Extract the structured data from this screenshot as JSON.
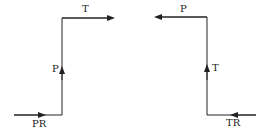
{
  "diagrams": [
    {
      "name": "left-path",
      "labels": {
        "input": "PR",
        "vertical": "P",
        "output": "T"
      }
    },
    {
      "name": "right-path",
      "labels": {
        "input": "TR",
        "vertical": "T",
        "output": "P"
      }
    }
  ],
  "colors": {
    "line": "#222222",
    "background": "#ffffff"
  }
}
